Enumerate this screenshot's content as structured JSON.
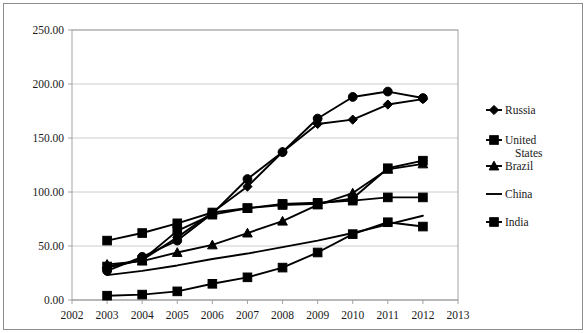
{
  "chart_data": {
    "type": "line",
    "title": "",
    "xlabel": "",
    "ylabel": "",
    "x": [
      2003,
      2004,
      2005,
      2006,
      2007,
      2008,
      2009,
      2010,
      2011,
      2012
    ],
    "xlim": [
      2002,
      2013
    ],
    "ylim": [
      0,
      250
    ],
    "xticks": [
      "2002",
      "2003",
      "2004",
      "2005",
      "2006",
      "2007",
      "2008",
      "2009",
      "2010",
      "2011",
      "2012",
      "2013"
    ],
    "yticks": [
      "0.00",
      "50.00",
      "100.00",
      "150.00",
      "200.00",
      "250.00"
    ],
    "grid": true,
    "legend_position": "right",
    "series": [
      {
        "name": "Russia",
        "marker": "diamond",
        "values": [
          30.0,
          37.0,
          58.0,
          81.0,
          105.0,
          137.0,
          163.0,
          167.0,
          181.0,
          186.0
        ]
      },
      {
        "name": "United States",
        "marker": "circle",
        "values": [
          27.0,
          40.0,
          55.0,
          80.0,
          112.0,
          137.0,
          168.0,
          188.0,
          193.0,
          187.0
        ]
      },
      {
        "name": "Brazil",
        "marker": "triangle",
        "values": [
          33.0,
          36.0,
          44.0,
          51.0,
          62.0,
          73.0,
          88.0,
          99.0,
          121.0,
          126.0
        ]
      },
      {
        "name": "China",
        "marker": "none",
        "values": [
          23.0,
          27.0,
          32.0,
          38.0,
          43.0,
          49.0,
          55.0,
          62.0,
          70.0,
          78.0
        ]
      },
      {
        "name": "India",
        "marker": "square",
        "values": [
          4.0,
          5.0,
          8.0,
          15.0,
          21.0,
          30.0,
          44.0,
          61.0,
          72.0,
          68.0
        ]
      }
    ],
    "extra_series": [
      {
        "name": "series-6",
        "marker": "square",
        "values": [
          55.0,
          62.0,
          71.0,
          81.0,
          85.0,
          89.0,
          90.0,
          92.0,
          95.0,
          95.0
        ]
      },
      {
        "name": "series-7",
        "marker": "square",
        "values": [
          31.0,
          37.0,
          64.0,
          79.0,
          85.0,
          88.0,
          89.0,
          94.0,
          122.0,
          129.0
        ]
      }
    ]
  },
  "legend": {
    "items": [
      {
        "label": "Russia",
        "marker": "diamond"
      },
      {
        "label": "United States",
        "marker": "square"
      },
      {
        "label": "Brazil",
        "marker": "triangle"
      },
      {
        "label": "China",
        "marker": "line"
      },
      {
        "label": "India",
        "marker": "square"
      }
    ]
  }
}
